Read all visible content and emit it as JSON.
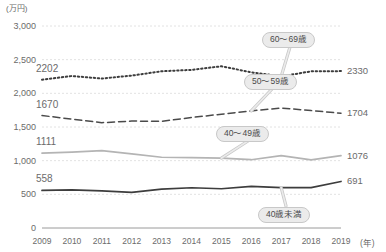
{
  "chart_data": {
    "type": "line",
    "title": "",
    "unit_label": "(万円)",
    "xlabel": "(年)",
    "ylabel": "",
    "x": [
      "2009",
      "2010",
      "2011",
      "2012",
      "2013",
      "2014",
      "2015",
      "2016",
      "2017",
      "2018",
      "2019"
    ],
    "ylim": [
      0,
      3000
    ],
    "yticks": [
      "0",
      "500",
      "1,000",
      "1,500",
      "2,000",
      "2,500",
      "3,000"
    ],
    "ytick_values": [
      0,
      500,
      1000,
      1500,
      2000,
      2500,
      3000
    ],
    "grid": true,
    "legend_position": "callouts-on-lines",
    "series": [
      {
        "name": "60〜69歳",
        "style": "dotted",
        "color": "#3d3d3d",
        "start_label": "2202",
        "end_label": "2330",
        "values": [
          2202,
          2257,
          2220,
          2263,
          2328,
          2348,
          2402,
          2312,
          2252,
          2327,
          2330
        ]
      },
      {
        "name": "50〜59歳",
        "style": "dashed",
        "color": "#4a4a4a",
        "start_label": "1670",
        "end_label": "1704",
        "values": [
          1670,
          1617,
          1564,
          1588,
          1585,
          1641,
          1690,
          1739,
          1782,
          1744,
          1704
        ]
      },
      {
        "name": "40〜49歳",
        "style": "solid",
        "color": "#b4b4b4",
        "start_label": "1111",
        "end_label": "1076",
        "values": [
          1111,
          1128,
          1149,
          1101,
          1051,
          1044,
          1038,
          1014,
          1074,
          1012,
          1076
        ]
      },
      {
        "name": "40歳未満",
        "style": "solid",
        "color": "#3d3d3d",
        "start_label": "558",
        "end_label": "691",
        "values": [
          558,
          565,
          550,
          528,
          578,
          598,
          583,
          617,
          600,
          600,
          691
        ]
      }
    ],
    "callouts": [
      {
        "label": "60〜69歳",
        "series": "60〜69歳"
      },
      {
        "label": "50〜59歳",
        "series": "50〜59歳"
      },
      {
        "label": "40〜49歳",
        "series": "40〜49歳"
      },
      {
        "label": "40歳未満",
        "series": "40歳未満"
      }
    ]
  }
}
